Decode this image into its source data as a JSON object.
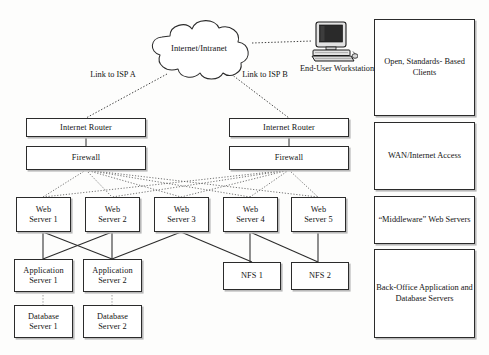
{
  "diagram": {
    "background_color": "#fdfdfc",
    "line_color": "#2b2b2b",
    "shadow_color": "#b9b9b9"
  },
  "cloud": {
    "label": "Internet/Intranet",
    "icon": "cloud-icon"
  },
  "workstation": {
    "icon": "desktop-computer-icon",
    "label_line1": "End-User",
    "label_line2": "Workstation"
  },
  "links": [
    {
      "line1": "Link to",
      "line2": "ISP A"
    },
    {
      "line1": "Link to",
      "line2": "ISP B"
    }
  ],
  "routers": [
    {
      "label": "Internet Router"
    },
    {
      "label": "Internet Router"
    }
  ],
  "firewalls": [
    {
      "label": "Firewall"
    },
    {
      "label": "Firewall"
    }
  ],
  "web_servers": [
    {
      "line1": "Web",
      "line2": "Server 1"
    },
    {
      "line1": "Web",
      "line2": "Server 2"
    },
    {
      "line1": "Web",
      "line2": "Server 3"
    },
    {
      "line1": "Web",
      "line2": "Server 4"
    },
    {
      "line1": "Web",
      "line2": "Server 5"
    }
  ],
  "application_servers": [
    {
      "line1": "Application",
      "line2": "Server 1"
    },
    {
      "line1": "Application",
      "line2": "Server 2"
    }
  ],
  "database_servers": [
    {
      "line1": "Database",
      "line2": "Server 1"
    },
    {
      "line1": "Database",
      "line2": "Server 2"
    }
  ],
  "nfs_servers": [
    {
      "label": "NFS 1"
    },
    {
      "label": "NFS 2"
    }
  ],
  "legend": [
    {
      "line1": "Open,",
      "line2": "Standards-",
      "line3": "Based Clients"
    },
    {
      "line1": "WAN/Internet",
      "line2": "Access",
      "line3": ""
    },
    {
      "line1": "“Middleware”",
      "line2": "Web Servers",
      "line3": ""
    },
    {
      "line1": "Back-Office",
      "line2": "Application and",
      "line3": "Database Servers"
    }
  ]
}
